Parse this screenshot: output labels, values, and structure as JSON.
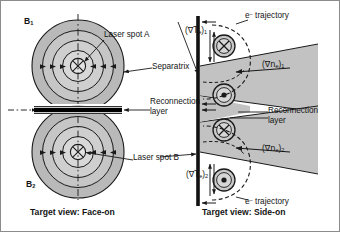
{
  "figure": {
    "panels": [
      {
        "id": "face-on",
        "caption": "Target view: Face-on",
        "field_labels": [
          {
            "base": "B",
            "sub": "1"
          },
          {
            "base": "B",
            "sub": "2"
          }
        ],
        "annotations": [
          "Laser spot A",
          "Separatrix",
          "Reconnection layer",
          "Laser spot B"
        ]
      },
      {
        "id": "side-on",
        "caption": "Target view: Side-on",
        "annotations": [
          "e- trajectory",
          "Reconnection layer",
          "e- trajectory"
        ],
        "gradients": [
          {
            "symbol": "∇T",
            "species": "e",
            "index": "1"
          },
          {
            "symbol": "∇n",
            "species": "e",
            "index": "1"
          },
          {
            "symbol": "∇n",
            "species": "e",
            "index": "2"
          },
          {
            "symbol": "∇T",
            "species": "e",
            "index": "2"
          }
        ]
      }
    ]
  },
  "labels": {
    "b1_base": "B",
    "b1_sub": "1",
    "b2_base": "B",
    "b2_sub": "2",
    "laser_spot_a": "Laser spot A",
    "laser_spot_b": "Laser spot B",
    "separatrix": "Separatrix",
    "reconnection_left_line1": "Reconnection",
    "reconnection_left_line2": "layer",
    "reconnection_right_line1": "Reconnection",
    "reconnection_right_line2": "layer",
    "e_traj_top_e": "e",
    "e_traj_top_minus": "−",
    "e_traj_top_word": " trajectory",
    "e_traj_bot_e": "e",
    "e_traj_bot_minus": "−",
    "e_traj_bot_word": " trajectory",
    "caption_left": "Target view: Face-on",
    "caption_right": "Target view: Side-on",
    "grad_te1_open": "(",
    "grad_te1_nabla": "∇T",
    "grad_te1_species": "e",
    "grad_te1_close": ")",
    "grad_te1_index": "1",
    "grad_ne1_open": "(",
    "grad_ne1_nabla": "∇n",
    "grad_ne1_species": "e",
    "grad_ne1_close": ")",
    "grad_ne1_index": "1",
    "grad_ne2_open": "(",
    "grad_ne2_nabla": "∇n",
    "grad_ne2_species": "e",
    "grad_ne2_close": ")",
    "grad_ne2_index": "2",
    "grad_te2_open": "(",
    "grad_te2_nabla": "∇T",
    "grad_te2_species": "e",
    "grad_te2_close": ")",
    "grad_te2_index": "2"
  },
  "colors": {
    "background": "#ffffff",
    "stroke": "#1a1a1a",
    "text": "#141414",
    "bubble_outer": "#b9b9b9",
    "bubble_mid": "#c6c6c6",
    "bubble_inner": "#d2d2d2",
    "bubble_core": "#dcdcdc",
    "wedge_fill": "#c2c2c2",
    "layer_bar": "#000000",
    "border": "#8c8c8c"
  },
  "geometry": {
    "width": 340,
    "height": 232,
    "divider_x": 176,
    "top_bubble_center": {
      "x": 78,
      "y": 66
    },
    "bottom_bubble_center": {
      "x": 78,
      "y": 152
    },
    "bubble_radii": [
      46,
      35,
      25,
      15,
      7
    ],
    "reconnection_bar": {
      "x1": 36,
      "x2": 122,
      "y": 109,
      "thickness": 4
    },
    "target_line_x": 198,
    "target_line_y1": 18,
    "target_line_y2": 206
  }
}
